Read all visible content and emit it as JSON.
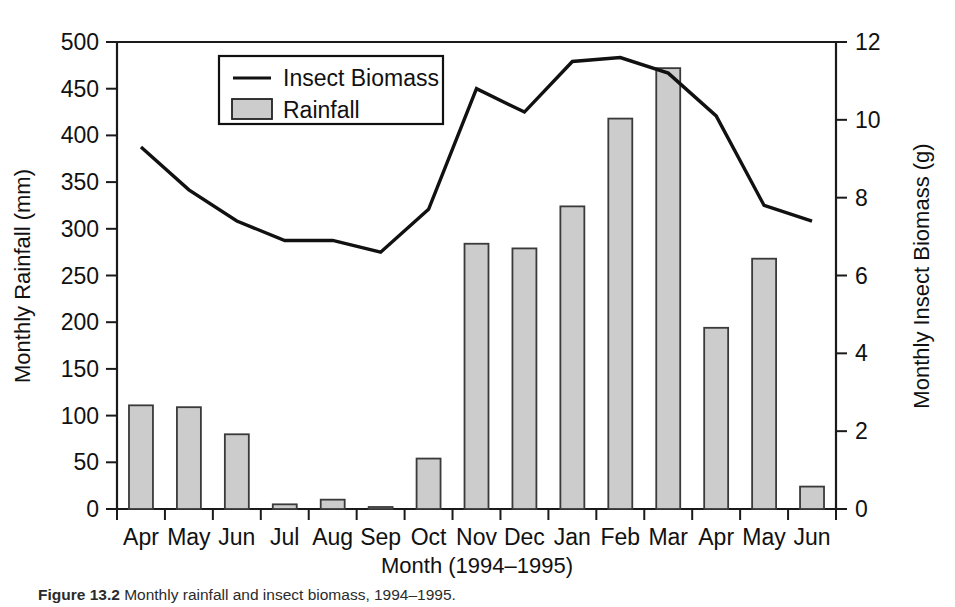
{
  "figure": {
    "caption_label": "Figure 13.2",
    "caption_text": "Monthly rainfall and insect biomass, 1994–1995."
  },
  "legend": {
    "position": "top-center-left",
    "entries": [
      {
        "label": "Insect Biomass",
        "marker": "line",
        "color": "#111111"
      },
      {
        "label": "Rainfall",
        "marker": "bar",
        "color": "#cccccc"
      }
    ]
  },
  "chart_data": {
    "type": "bar",
    "title": "",
    "subtitle": "",
    "xlabel": "Month (1994–1995)",
    "ylabel": "Monthly Rainfall (mm)",
    "y2label": "Monthly Insect Biomass (g)",
    "categories": [
      "Apr",
      "May",
      "Jun",
      "Jul",
      "Aug",
      "Sep",
      "Oct",
      "Nov",
      "Dec",
      "Jan",
      "Feb",
      "Mar",
      "Apr",
      "May",
      "Jun"
    ],
    "ylim": [
      0,
      500
    ],
    "yticks": [
      0,
      50,
      100,
      150,
      200,
      250,
      300,
      350,
      400,
      450,
      500
    ],
    "y2lim": [
      0,
      12
    ],
    "y2ticks": [
      0,
      2,
      4,
      6,
      8,
      10,
      12
    ],
    "grid": false,
    "series": [
      {
        "name": "Rainfall",
        "type": "bar",
        "axis": "left",
        "unit": "mm",
        "color": "#cccccc",
        "values": [
          111,
          109,
          80,
          5,
          10,
          2,
          54,
          284,
          279,
          324,
          418,
          472,
          194,
          268,
          24
        ]
      },
      {
        "name": "Insect Biomass",
        "type": "line",
        "axis": "right",
        "unit": "g",
        "color": "#111111",
        "values": [
          9.3,
          8.2,
          7.4,
          6.9,
          6.9,
          6.6,
          7.7,
          10.8,
          10.2,
          11.5,
          11.6,
          11.2,
          10.1,
          7.8,
          7.4
        ]
      }
    ]
  }
}
